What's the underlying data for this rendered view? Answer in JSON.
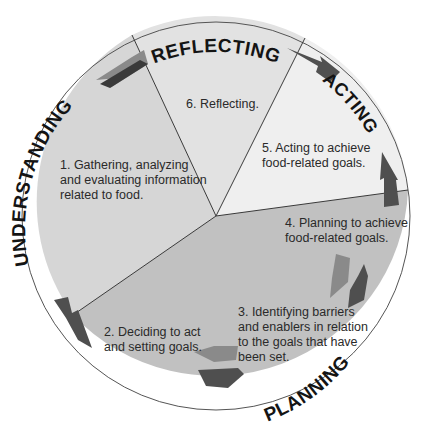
{
  "diagram": {
    "type": "cycle",
    "center": [
      216,
      216
    ],
    "radius": 194,
    "colors": {
      "understanding": "#d6d6d6",
      "reflecting": "#e2e2e2",
      "acting": "#efefef",
      "planning": "#c1c1c1",
      "divider": "#3a3a3a",
      "arrow_dark": "#4f4f4f",
      "arrow_light": "#8a8a8a",
      "label": "#141414"
    },
    "stages": {
      "understanding": "UNDERSTANDING",
      "reflecting": "REFLECTING",
      "acting": "ACTING",
      "planning": "PLANNING"
    },
    "steps": {
      "step1": [
        "1. Gathering, analyzing",
        "and evaluating information",
        "related to food."
      ],
      "step2": [
        "2. Deciding to act",
        "and setting goals."
      ],
      "step3": [
        "3. Identifying barriers",
        "and enablers in relation",
        "to the goals that have",
        "been set."
      ],
      "step4": [
        "4. Planning to achieve",
        "food-related goals."
      ],
      "step5": [
        "5. Acting to achieve",
        "food-related goals."
      ],
      "step6": [
        "6. Reflecting."
      ]
    }
  }
}
